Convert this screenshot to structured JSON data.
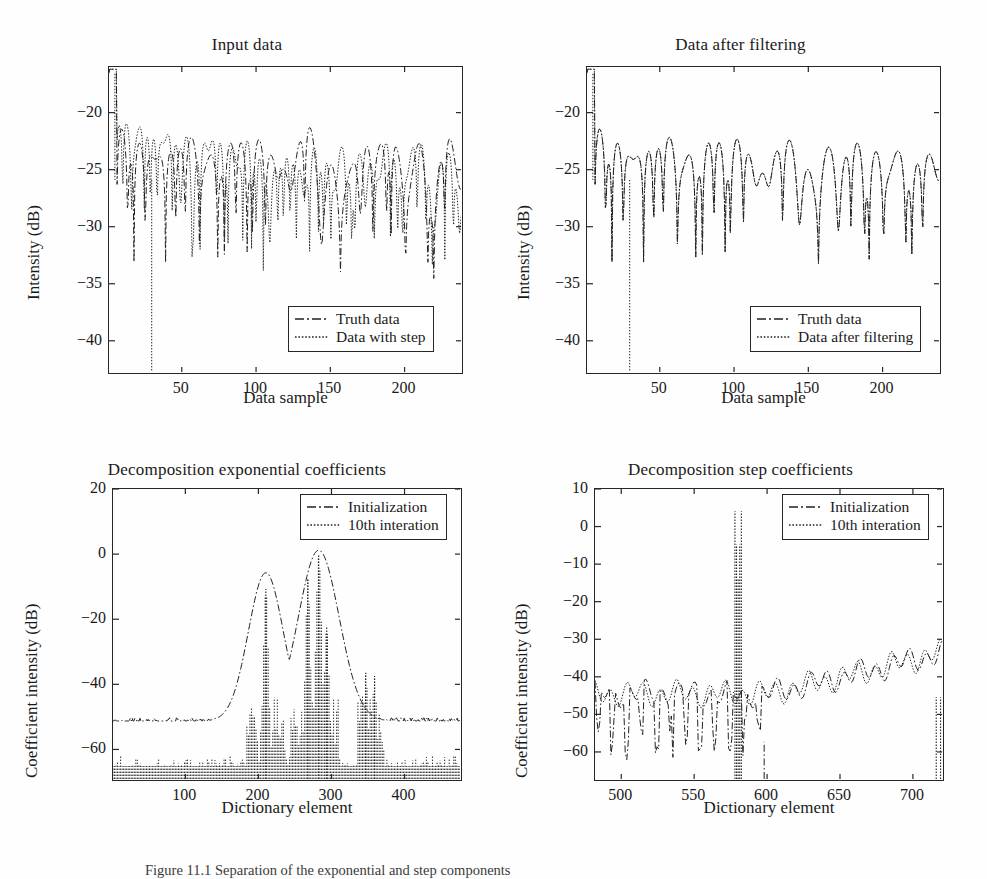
{
  "figure": {
    "caption": "Figure 11.1  Separation of the exponential and step components"
  },
  "chart_data": [
    {
      "id": "input-data",
      "type": "line",
      "title": "Input data",
      "xlabel": "Data sample",
      "ylabel": "Intensity (dB)",
      "xlim": [
        1,
        240
      ],
      "ylim": [
        -43,
        -16
      ],
      "xticks": [
        50,
        100,
        150,
        200
      ],
      "yticks": [
        -20,
        -25,
        -30,
        -35,
        -40
      ],
      "grid": false,
      "legend_position": "lower-right",
      "series": [
        {
          "name": "Truth data",
          "style": "dash-dot"
        },
        {
          "name": "Data with step",
          "style": "dotted"
        }
      ],
      "seed_truth": 1301,
      "seed_other": 2207,
      "divergence_start": 0.42,
      "deep_null_x": 30,
      "deep_null_y": -43
    },
    {
      "id": "data-after-filtering",
      "type": "line",
      "title": "Data after filtering",
      "xlabel": "Data sample",
      "ylabel": "Intensity (dB)",
      "xlim": [
        1,
        240
      ],
      "ylim": [
        -43,
        -16
      ],
      "xticks": [
        50,
        100,
        150,
        200
      ],
      "yticks": [
        -20,
        -25,
        -30,
        -35,
        -40
      ],
      "grid": false,
      "legend_position": "lower-right",
      "series": [
        {
          "name": "Truth data",
          "style": "dash-dot"
        },
        {
          "name": "Data after filtering",
          "style": "dotted"
        }
      ],
      "seed_truth": 1301,
      "seed_other": 1301,
      "divergence_start": 1.0,
      "deep_null_x": 30,
      "deep_null_y": -43
    },
    {
      "id": "decomposition-exponential-coefficients",
      "type": "line",
      "title": "Decomposition exponential coefficients",
      "xlabel": "Dictionary element",
      "ylabel": "Coefficient intensity (dB)",
      "xlim": [
        1,
        480
      ],
      "ylim": [
        -70,
        20
      ],
      "xticks": [
        100,
        200,
        300,
        400
      ],
      "yticks": [
        20,
        0,
        -20,
        -40,
        -60
      ],
      "grid": false,
      "legend_position": "upper-right",
      "series": [
        {
          "name": "Initialization",
          "style": "dash-dot"
        },
        {
          "name": "10th interation",
          "style": "dotted"
        }
      ],
      "baseline_db": -52,
      "peaks_init": [
        {
          "x": 212,
          "y": -6,
          "w": 34
        },
        {
          "x": 285,
          "y": 1,
          "w": 40
        }
      ],
      "peaks_iter": [
        {
          "x": 212,
          "y": -11,
          "w": 5
        },
        {
          "x": 270,
          "y": -8,
          "w": 5
        },
        {
          "x": 285,
          "y": -0.5,
          "w": 6
        },
        {
          "x": 296,
          "y": -23,
          "w": 5
        },
        {
          "x": 350,
          "y": -37,
          "w": 4
        },
        {
          "x": 362,
          "y": -38,
          "w": 4
        }
      ],
      "noise_floor_db": -66,
      "seed_init": 77,
      "seed_iter": 915
    },
    {
      "id": "decomposition-step-coefficients",
      "type": "line",
      "title": "Decomposition step coefficients",
      "xlabel": "Dictionary element",
      "ylabel": "Coefficient intensity (dB)",
      "xlim": [
        482,
        722
      ],
      "ylim": [
        -68,
        10
      ],
      "xticks": [
        500,
        550,
        600,
        650,
        700
      ],
      "yticks": [
        10,
        0,
        -10,
        -20,
        -30,
        -40,
        -50,
        -60
      ],
      "grid": false,
      "legend_position": "upper-right",
      "series": [
        {
          "name": "Initialization",
          "style": "dash-dot"
        },
        {
          "name": "10th interation",
          "style": "dotted"
        }
      ],
      "baseline_db": -45,
      "ramp_end_db": -34,
      "ramp_start_x": 600,
      "main_peak": {
        "x": 581,
        "y": -14
      },
      "seed_init": 404,
      "seed_iter": 808
    }
  ]
}
